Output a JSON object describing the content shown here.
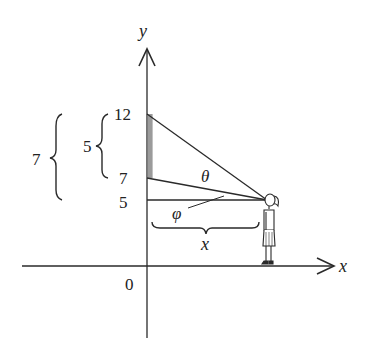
{
  "diagram": {
    "type": "geometry-viewing-angle",
    "axes": {
      "x_label": "x",
      "y_label": "y",
      "origin_label": "0"
    },
    "y_ticks": [
      {
        "value": "12",
        "pixel_y": 114
      },
      {
        "value": "7",
        "pixel_y": 178
      },
      {
        "value": "5",
        "pixel_y": 200
      }
    ],
    "angles": {
      "theta_label": "θ",
      "phi_label": "φ"
    },
    "distance_label": "x",
    "brace_labels": {
      "outer": "7",
      "inner": "5"
    },
    "figure": "person-standing-observer",
    "colors": {
      "line": "#2a2a2a",
      "screen_shade": "#8a8a8a",
      "background": "#ffffff"
    }
  }
}
